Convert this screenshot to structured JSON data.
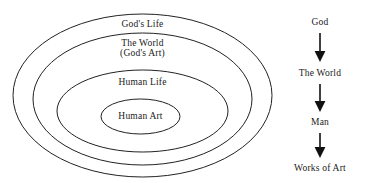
{
  "figure": {
    "type": "diagram",
    "background_color": "#ffffff",
    "line_color": "#222222",
    "text_color": "#1a1a1a"
  },
  "nested_diagram": {
    "name": "concentric-ellipses",
    "rings": [
      {
        "id": "ring-gods-life",
        "label": "God's Life",
        "label_line2": "",
        "depth": 1,
        "cx": 142.5,
        "cy": 95.5,
        "rx": 129.5,
        "ry": 81.5,
        "label_x": 142.5,
        "label_y": 24
      },
      {
        "id": "ring-the-world",
        "label": "The World",
        "label_line2": "(God's Art)",
        "depth": 2,
        "cx": 142.5,
        "cy": 99,
        "rx": 109.5,
        "ry": 66,
        "label_x": 142.5,
        "label_y": 43
      },
      {
        "id": "ring-human-life",
        "label": "Human Life",
        "label_line2": "",
        "depth": 3,
        "cx": 142.5,
        "cy": 111,
        "rx": 85.5,
        "ry": 41,
        "label_x": 142.5,
        "label_y": 82
      },
      {
        "id": "ring-human-art",
        "label": "Human Art",
        "label_line2": "",
        "depth": 4,
        "cx": 140.5,
        "cy": 116.5,
        "rx": 39.5,
        "ry": 17.5,
        "label_x": 140.5,
        "label_y": 116
      }
    ]
  },
  "flow_chart": {
    "name": "creation-flow",
    "axis_x": 320,
    "nodes": [
      {
        "id": "flow-god",
        "label": "God",
        "x": 320,
        "y": 22
      },
      {
        "id": "flow-the-world",
        "label": "The World",
        "x": 320,
        "y": 73
      },
      {
        "id": "flow-man",
        "label": "Man",
        "x": 320,
        "y": 122
      },
      {
        "id": "flow-works-of-art",
        "label": "Works of Art",
        "x": 320,
        "y": 168
      }
    ],
    "arrows": [
      {
        "id": "arrow-god-to-world",
        "x": 320,
        "y1": 33,
        "y2": 62,
        "icon": "arrow-down-icon"
      },
      {
        "id": "arrow-world-to-man",
        "x": 320,
        "y1": 84,
        "y2": 112,
        "icon": "arrow-down-icon"
      },
      {
        "id": "arrow-man-to-works",
        "x": 320,
        "y1": 133,
        "y2": 158,
        "icon": "arrow-down-icon"
      }
    ]
  }
}
